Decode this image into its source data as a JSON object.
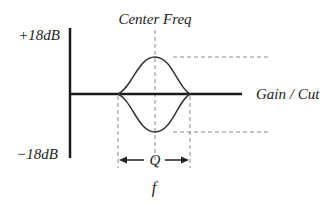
{
  "diagram": {
    "labels": {
      "center_freq": "Center Freq",
      "gain_max": "+18dB",
      "gain_min": "−18dB",
      "gain_cut": "Gain / Cut",
      "q": "Q",
      "f": "f"
    },
    "colors": {
      "axis": "#1a1a1a",
      "curve": "#333333",
      "dashed": "#888888",
      "text": "#222222"
    }
  }
}
